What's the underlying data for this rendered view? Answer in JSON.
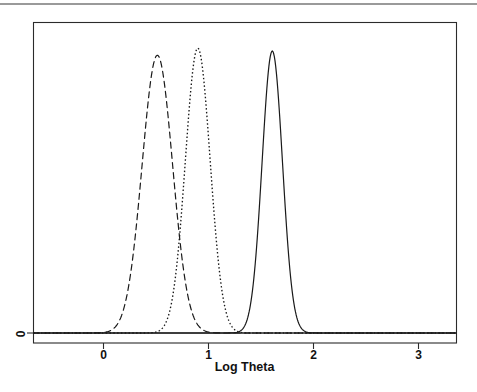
{
  "figure": {
    "kind": "statistical-density-plot",
    "background_color": "#ffffff",
    "ink_color": "#1a1a1a"
  },
  "axis": {
    "x_title": "Log Theta",
    "x_tick_labels": [
      "0",
      "1",
      "2",
      "3"
    ],
    "y_tick_labels": [
      "0"
    ]
  },
  "chart_data": {
    "type": "line",
    "title": "",
    "subtitle": "",
    "xlabel": "Log Theta",
    "ylabel": "",
    "xlim": [
      -0.66,
      3.37
    ],
    "ylim": [
      0,
      1.09
    ],
    "x_ticks": [
      0,
      1,
      2,
      3
    ],
    "x_tick_labels": [
      "0",
      "1",
      "2",
      "3"
    ],
    "y_ticks": [
      0
    ],
    "y_tick_labels": [
      "0"
    ],
    "grid": false,
    "legend": "none",
    "frame": "box",
    "series": [
      {
        "name": "dashed-density",
        "linestyle": "dashed",
        "color": "#1a1a1a",
        "peak_x": 0.52,
        "peak_y": 0.975,
        "sigma": 0.145,
        "x_range": [
          -0.66,
          3.37
        ]
      },
      {
        "name": "dotted-density",
        "linestyle": "dotted",
        "color": "#1a1a1a",
        "peak_x": 0.905,
        "peak_y": 1.0,
        "sigma": 0.118,
        "x_range": [
          -0.66,
          3.37
        ]
      },
      {
        "name": "solid-density",
        "linestyle": "solid",
        "color": "#1a1a1a",
        "peak_x": 1.615,
        "peak_y": 0.99,
        "sigma": 0.097,
        "x_range": [
          -0.66,
          3.37
        ]
      }
    ]
  }
}
